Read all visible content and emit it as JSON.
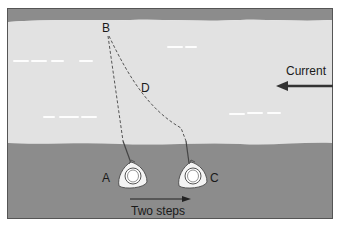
{
  "diagram": {
    "type": "fly-fishing drift illustration",
    "colors": {
      "bank": "#8c8c8c",
      "water": "#e2e2e2",
      "frame": "#555555",
      "line": "#555555",
      "streak": "#ffffff",
      "text": "#1a1a1a"
    },
    "points": {
      "A": {
        "label": "A"
      },
      "B": {
        "label": "B"
      },
      "C": {
        "label": "C"
      },
      "D": {
        "label": "D"
      }
    },
    "current": {
      "label": "Current",
      "direction": "left"
    },
    "steps": {
      "label": "Two steps",
      "direction": "right"
    }
  }
}
